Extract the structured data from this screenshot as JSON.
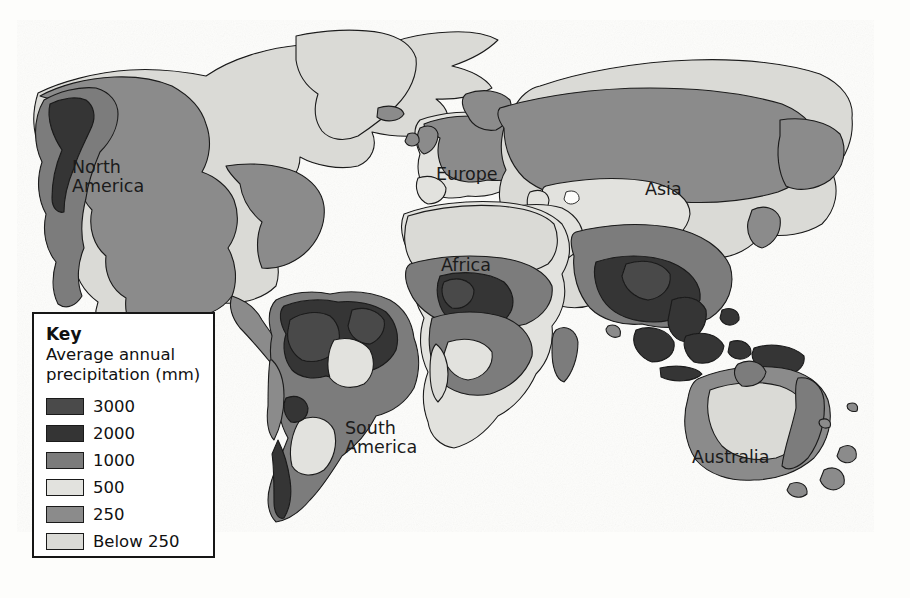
{
  "figure": {
    "kind": "thematic-world-map",
    "background_color": "#fdfdfb",
    "ocean_color": "#ffffff",
    "outline_color": "#1a1a1a"
  },
  "map": {
    "labels": [
      {
        "id": "north-america",
        "text": "North\nAmerica"
      },
      {
        "id": "europe",
        "text": "Europe"
      },
      {
        "id": "asia",
        "text": "Asia"
      },
      {
        "id": "africa",
        "text": "Africa"
      },
      {
        "id": "south-america",
        "text": "South\nAmerica"
      },
      {
        "id": "australia",
        "text": "Australia"
      }
    ]
  },
  "legend": {
    "title": "Key",
    "subtitle": "Average annual\nprecipitation (mm)",
    "items": [
      {
        "value": "3000",
        "color": "#4a4a4a"
      },
      {
        "value": "2000",
        "color": "#343434"
      },
      {
        "value": "1000",
        "color": "#7b7b7b"
      },
      {
        "value": "500",
        "color": "#e2e2de"
      },
      {
        "value": "250",
        "color": "#8b8b8b"
      },
      {
        "value": "Below 250",
        "color": "#dadad6"
      }
    ]
  },
  "scan_artifacts": {
    "top_bleed": "the distribution of precipitation across the world",
    "bottom_bleed_1": "regions receive",
    "bottom_bleed_2": "rainfall than others"
  },
  "chart_data": {
    "type": "map",
    "title": "Average annual precipitation (mm)",
    "classification": "choropleth / isohyet bands",
    "projection": "world (cylindrical)",
    "legend_position": "lower-left inset box",
    "grid": false,
    "categories": [
      "3000",
      "2000",
      "1000",
      "500",
      "250",
      "Below 250"
    ],
    "category_colors": [
      "#4a4a4a",
      "#343434",
      "#7b7b7b",
      "#e2e2de",
      "#8b8b8b",
      "#dadad6"
    ],
    "units": "mm",
    "regions_labelled": [
      "North America",
      "Europe",
      "Asia",
      "Africa",
      "South America",
      "Australia"
    ],
    "notable_features": [
      {
        "region": "Amazon Basin, South America",
        "band": "2000-3000"
      },
      {
        "region": "Congo Basin / West Africa",
        "band": "2000-3000"
      },
      {
        "region": "South and Southeast Asia",
        "band": "2000-3000"
      },
      {
        "region": "Pacific Northwest, North America",
        "band": "1000-2000"
      },
      {
        "region": "Sahara, North Africa",
        "band": "Below 250"
      },
      {
        "region": "Central Australia",
        "band": "Below 250"
      },
      {
        "region": "Central Asia / Gobi",
        "band": "Below 250"
      },
      {
        "region": "Greenland and Arctic",
        "band": "Below 250"
      }
    ]
  }
}
